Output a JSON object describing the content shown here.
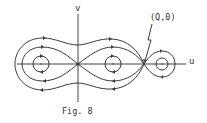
{
  "figure": {
    "caption": "Fig. 8",
    "axes": {
      "horizontal_label": "u",
      "vertical_label": "v"
    },
    "annotations": [
      {
        "label": "(Q,0)",
        "points_to": "saddle point on u-axis right of origin"
      }
    ],
    "critical_points": [
      {
        "name": "origin",
        "type": "saddle"
      },
      {
        "name": "(Q,0)",
        "type": "saddle"
      },
      {
        "name": "left-center",
        "type": "center"
      },
      {
        "name": "middle-center",
        "type": "center"
      },
      {
        "name": "right-center",
        "type": "center"
      }
    ],
    "colors": {
      "line": "#3a3a3a",
      "background": "#ffffff"
    }
  }
}
